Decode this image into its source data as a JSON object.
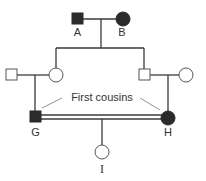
{
  "diagram": {
    "type": "pedigree",
    "annotation": "First cousins",
    "colors": {
      "affected": "#2b2b2b",
      "unaffected": "#ffffff",
      "line": "#3a3a3a"
    },
    "individuals": {
      "A": {
        "label": "A",
        "sex": "male",
        "affected": true
      },
      "B": {
        "label": "B",
        "sex": "female",
        "affected": true
      },
      "G": {
        "label": "G",
        "sex": "male",
        "affected": true
      },
      "H": {
        "label": "H",
        "sex": "female",
        "affected": true
      },
      "I": {
        "label": "I",
        "sex": "female",
        "affected": false
      }
    }
  }
}
